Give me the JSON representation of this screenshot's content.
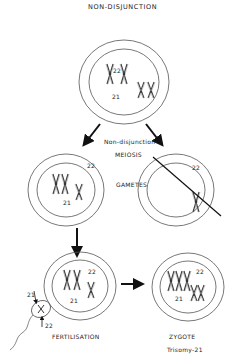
{
  "title": "NON-DISJUNCTION",
  "labels": {
    "non_disjunction": "Non-disjunction",
    "meiosis": "MEIOSIS",
    "gametes": "GAMETES",
    "fertilisation": "FERTILISATION",
    "zygote": "ZYGOTE",
    "trisomy": "Trisomy-21"
  },
  "chromosome_labels": {
    "parent_21": "21",
    "parent_22": "22",
    "gamete_left_21": "21",
    "gamete_left_22": "22",
    "gamete_right_22": "22",
    "fert_21": "21",
    "fert_22": "22",
    "sperm_21": "21",
    "sperm_22": "22",
    "zygote_21": "21",
    "zygote_22": "22"
  },
  "colors": {
    "line": "#333333",
    "background": "#ffffff"
  }
}
